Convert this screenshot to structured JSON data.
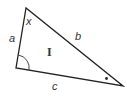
{
  "diagram": {
    "type": "triangle",
    "stroke_color": "#222222",
    "vertices": {
      "top": [
        26,
        8
      ],
      "bottom_left": [
        16,
        68
      ],
      "right": [
        123,
        86
      ]
    },
    "labels": {
      "angle_top": "x",
      "side_a": "a",
      "side_b": "b",
      "side_c": "c",
      "region": "I"
    },
    "markers": {
      "bottom_left_angle": "arc",
      "right_angle_marker": "dot"
    }
  }
}
